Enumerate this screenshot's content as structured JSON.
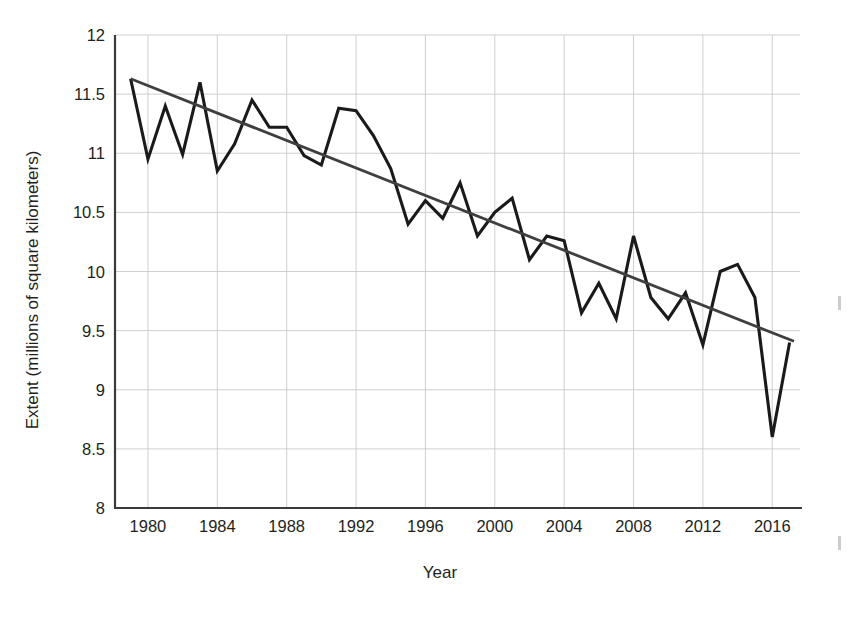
{
  "chart_data": {
    "type": "line",
    "title": "",
    "xlabel": "Year",
    "ylabel": "Extent (millions of square kilometers)",
    "xlim": [
      1978.1,
      2017.6
    ],
    "ylim": [
      8,
      12
    ],
    "grid": true,
    "legend": "none",
    "x_ticks": [
      1980,
      1984,
      1988,
      1992,
      1996,
      2000,
      2004,
      2008,
      2012,
      2016
    ],
    "x_tick_labels": [
      "1980",
      "1984",
      "1988",
      "1992",
      "1996",
      "2000",
      "2004",
      "2008",
      "2012",
      "2016"
    ],
    "y_ticks": [
      8,
      8.5,
      9,
      9.5,
      10,
      10.5,
      11,
      11.5,
      12
    ],
    "y_tick_labels": [
      "8",
      "8.5",
      "9",
      "9.5",
      "10",
      "10.5",
      "11",
      "11.5",
      "12"
    ],
    "x": [
      1979,
      1980,
      1981,
      1982,
      1983,
      1984,
      1985,
      1986,
      1987,
      1988,
      1989,
      1990,
      1991,
      1992,
      1993,
      1994,
      1995,
      1996,
      1997,
      1998,
      1999,
      2000,
      2001,
      2002,
      2003,
      2004,
      2005,
      2006,
      2007,
      2008,
      2009,
      2010,
      2011,
      2012,
      2013,
      2014,
      2015,
      2016,
      2017
    ],
    "series": [
      {
        "name": "Sea ice extent",
        "values": [
          11.63,
          10.95,
          11.4,
          10.99,
          11.6,
          10.85,
          11.08,
          11.45,
          11.22,
          11.22,
          10.98,
          10.9,
          11.38,
          11.36,
          11.15,
          10.87,
          10.4,
          10.6,
          10.45,
          10.75,
          10.3,
          10.5,
          10.62,
          10.1,
          10.3,
          10.26,
          9.65,
          9.9,
          9.6,
          10.3,
          9.78,
          9.6,
          9.82,
          9.38,
          10.0,
          10.06,
          9.78,
          8.6,
          9.4
        ]
      },
      {
        "name": "Linear trend",
        "type": "trend",
        "x_endpoints": [
          1979,
          2017.25
        ],
        "y_endpoints": [
          11.63,
          9.41
        ]
      }
    ]
  },
  "labels": {
    "x_axis_title": "Year",
    "y_axis_title": "Extent (millions of square kilometers)"
  }
}
